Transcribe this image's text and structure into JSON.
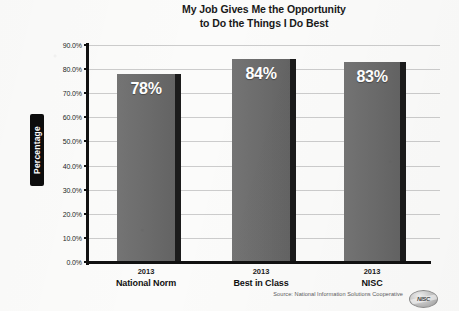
{
  "chart_data": {
    "type": "bar",
    "title": "My Job Gives Me the Opportunity to Do the Things I Do Best",
    "title_lines": [
      "My Job Gives Me the Opportunity",
      "to Do the Things I Do Best"
    ],
    "categories": [
      "National Norm",
      "Best in Class",
      "NISC"
    ],
    "category_years": [
      "2013",
      "2013",
      "2013"
    ],
    "values": [
      78,
      84,
      83
    ],
    "value_labels": [
      "78%",
      "84%",
      "83%"
    ],
    "xlabel": "",
    "ylabel": "Percentage",
    "ylim": [
      0,
      90
    ],
    "ytick_labels": [
      "90.0%",
      "80.0%",
      "70.0%",
      "60.0%",
      "50.0%",
      "40.0%",
      "30.0%",
      "20.0%",
      "10.0%",
      "0.0%"
    ],
    "ytick_values": [
      90,
      80,
      70,
      60,
      50,
      40,
      30,
      20,
      10,
      0
    ],
    "grid": true,
    "legend": "none",
    "bar_color": "#6e6e6e",
    "bar_shadow_color": "#1b1b1b",
    "axis_color": "#111111",
    "gridline_color": "#cccccc",
    "value_label_color": "#ffffff"
  },
  "source": {
    "note": "Source: National Information Solutions Cooperative",
    "logo_text": "NISC"
  }
}
